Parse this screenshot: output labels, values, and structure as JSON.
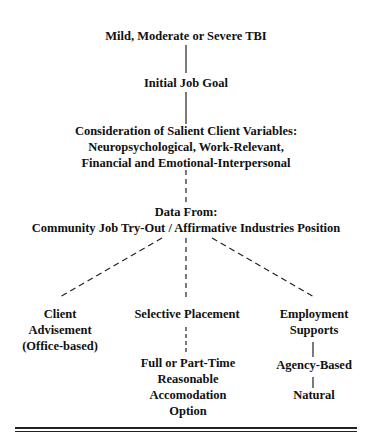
{
  "diagram": {
    "nodes": {
      "tbi": "Mild, Moderate or Severe TBI",
      "goal": "Initial Job Goal",
      "consider_1": "Consideration of Salient Client Variables:",
      "consider_2": "Neuropsychological, Work-Relevant,",
      "consider_3": "Financial and Emotional-Interpersonal",
      "data_1": "Data From:",
      "data_2": "Community Job Try-Out / Affirmative Industries Position",
      "client_1": "Client",
      "client_2": "Advisement",
      "client_3": "(Office-based)",
      "selective": "Selective Placement",
      "fullpart_1": "Full or Part-Time",
      "fullpart_2": "Reasonable",
      "fullpart_3": "Accomodation",
      "fullpart_4": "Option",
      "employ_1": "Employment",
      "employ_2": "Supports",
      "agency": "Agency-Based",
      "natural": "Natural"
    },
    "edges": [
      {
        "from": "tbi",
        "to": "goal",
        "style": "solid"
      },
      {
        "from": "goal",
        "to": "consider",
        "style": "solid"
      },
      {
        "from": "consider",
        "to": "data",
        "style": "dashed"
      },
      {
        "from": "data",
        "to": "client",
        "style": "dashed"
      },
      {
        "from": "data",
        "to": "selective",
        "style": "dashed"
      },
      {
        "from": "data",
        "to": "employ",
        "style": "dashed"
      },
      {
        "from": "selective",
        "to": "fullpart",
        "style": "dashed"
      },
      {
        "from": "employ",
        "to": "agency",
        "style": "solid"
      },
      {
        "from": "agency",
        "to": "natural",
        "style": "solid"
      }
    ]
  }
}
